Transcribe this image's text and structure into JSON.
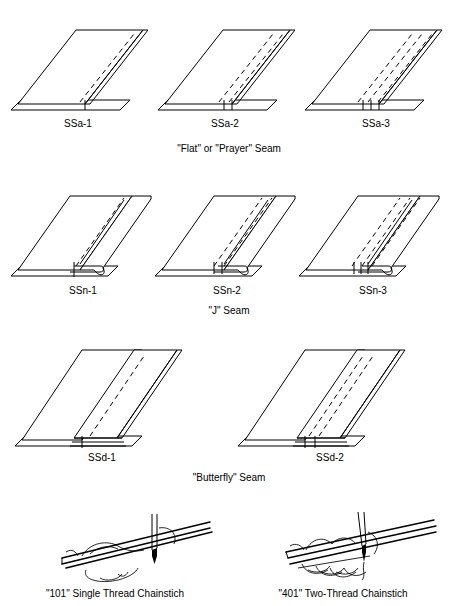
{
  "document": {
    "title": "Seam Types and Stitch Classes"
  },
  "rows": [
    {
      "id": "ssa",
      "caption": "\"Flat\" or \"Prayer\" Seam",
      "figures": [
        {
          "label": "SSa-1",
          "stitch_lines": 1
        },
        {
          "label": "SSa-2",
          "stitch_lines": 2
        },
        {
          "label": "SSa-3",
          "stitch_lines": 3
        }
      ]
    },
    {
      "id": "ssn",
      "caption": "\"J\" Seam",
      "figures": [
        {
          "label": "SSn-1",
          "stitch_lines": 1
        },
        {
          "label": "SSn-2",
          "stitch_lines": 2
        },
        {
          "label": "SSn-3",
          "stitch_lines": 3
        }
      ]
    },
    {
      "id": "ssd",
      "caption": "\"Butterfly\" Seam",
      "figures": [
        {
          "label": "SSd-1",
          "stitch_lines": 1
        },
        {
          "label": "SSd-2",
          "stitch_lines": 2
        }
      ]
    }
  ],
  "stitches": [
    {
      "id": "stitch-101",
      "caption": "\"101\" Single Thread Chainstich",
      "needles": 1
    },
    {
      "id": "stitch-401",
      "caption": "\"401\" Two-Thread Chainstich",
      "needles": 2
    }
  ],
  "colors": {
    "ink": "#000000",
    "paper": "#ffffff"
  }
}
